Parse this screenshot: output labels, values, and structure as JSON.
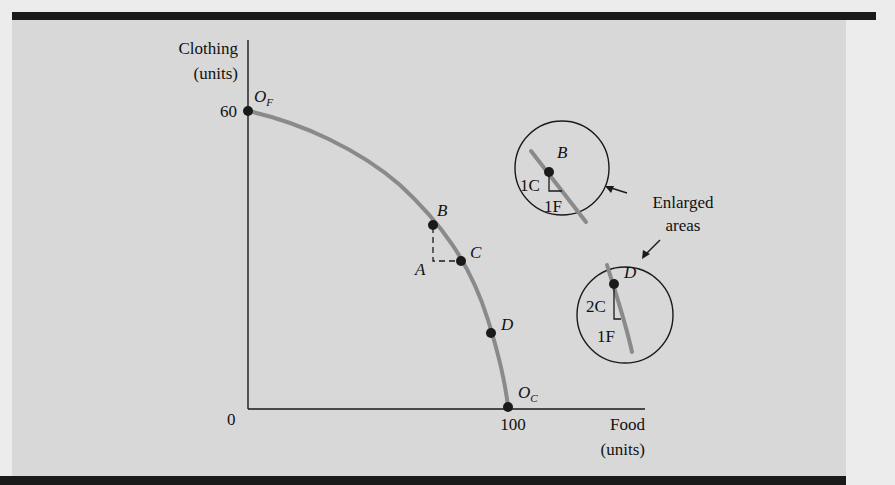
{
  "diagram": {
    "type": "production-possibilities-frontier",
    "y_axis": {
      "label_line1": "Clothing",
      "label_line2": "(units)",
      "tick": "60"
    },
    "x_axis": {
      "label_line1": "Food",
      "label_line2": "(units)",
      "tick": "100"
    },
    "origin_label": "0",
    "endpoints": {
      "of": {
        "main": "O",
        "sub": "F"
      },
      "oc": {
        "main": "O",
        "sub": "C"
      }
    },
    "points": {
      "a": "A",
      "b": "B",
      "c": "C",
      "d": "D"
    },
    "enlarged_b": {
      "point": "B",
      "vertical": "1C",
      "horizontal": "1F"
    },
    "enlarged_d": {
      "point": "D",
      "vertical": "2C",
      "horizontal": "1F"
    },
    "callout": {
      "line1": "Enlarged",
      "line2": "areas"
    },
    "colors": {
      "curve": "#8a8a8a",
      "axis": "#1a1a1a",
      "panel": "#d8d8d8",
      "bar": "#1a1a1a"
    }
  }
}
